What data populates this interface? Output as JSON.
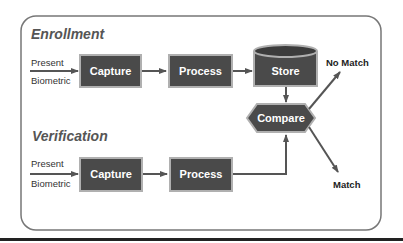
{
  "diagram": {
    "type": "flowchart",
    "colors": {
      "box_fill": "#4a4a4a",
      "box_border": "#b0b0b0",
      "arrow": "#555555",
      "frame": "#777777",
      "title": "#555555",
      "bottom_rule": "#222222"
    },
    "sections": {
      "enrollment": {
        "title": "Enrollment",
        "input_top": "Present",
        "input_bottom": "Biometric",
        "steps": [
          "Capture",
          "Process",
          "Store"
        ]
      },
      "verification": {
        "title": "Verification",
        "input_top": "Present",
        "input_bottom": "Biometric",
        "steps": [
          "Capture",
          "Process"
        ]
      }
    },
    "compare": {
      "label": "Compare"
    },
    "outcomes": {
      "no_match": "No Match",
      "match": "Match"
    }
  }
}
